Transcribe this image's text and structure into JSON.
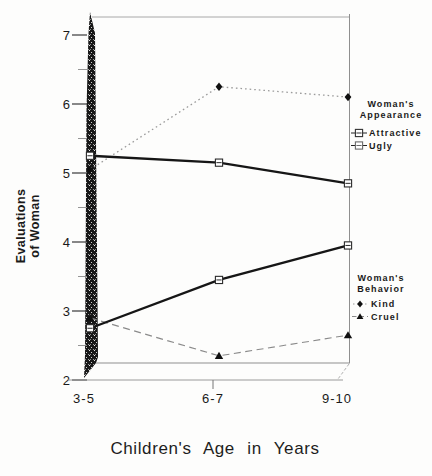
{
  "colors": {
    "ink": "#1a1a1a",
    "line_solid": "#161616",
    "line_dotted": "#9b9b9b",
    "line_dashed": "#8a8a8a",
    "frame": "#9a9a9a",
    "background": "#fdfdfc"
  },
  "chart_data": {
    "type": "line",
    "title": "",
    "xlabel": "Children's Age in Years",
    "ylabel": "Evaluations of Woman",
    "ylabel_lines": [
      "Evaluations",
      "of Woman"
    ],
    "categories": [
      "3-5",
      "6-7",
      "9-10"
    ],
    "y_ticks": [
      7,
      6,
      5,
      4,
      3,
      2
    ],
    "y_minor_ticks": [
      6.5,
      5.5,
      4.5,
      3.5,
      2.5
    ],
    "ylim": [
      2,
      7.3
    ],
    "grid": false,
    "legend_position": "right",
    "series": [
      {
        "name": "Kind",
        "group": "Woman's Behavior",
        "values": [
          5.05,
          6.25,
          6.1
        ],
        "line": "dotted",
        "marker": "diamond"
      },
      {
        "name": "Attractive",
        "group": "Woman's Appearance",
        "values": [
          5.25,
          5.15,
          4.85
        ],
        "line": "solid",
        "marker": "square-open"
      },
      {
        "name": "Ugly",
        "group": "Woman's Appearance",
        "values": [
          2.75,
          3.45,
          3.95
        ],
        "line": "solid",
        "marker": "square-open"
      },
      {
        "name": "Cruel",
        "group": "Woman's Behavior",
        "values": [
          2.9,
          2.35,
          2.65
        ],
        "line": "dashed",
        "marker": "triangle"
      }
    ],
    "legends": [
      {
        "title_lines": [
          "Woman's",
          "Appearance"
        ],
        "items": [
          "Attractive",
          "Ugly"
        ]
      },
      {
        "title_lines": [
          "Woman's",
          "Behavior"
        ],
        "items": [
          "Kind",
          "Cruel"
        ]
      }
    ]
  }
}
